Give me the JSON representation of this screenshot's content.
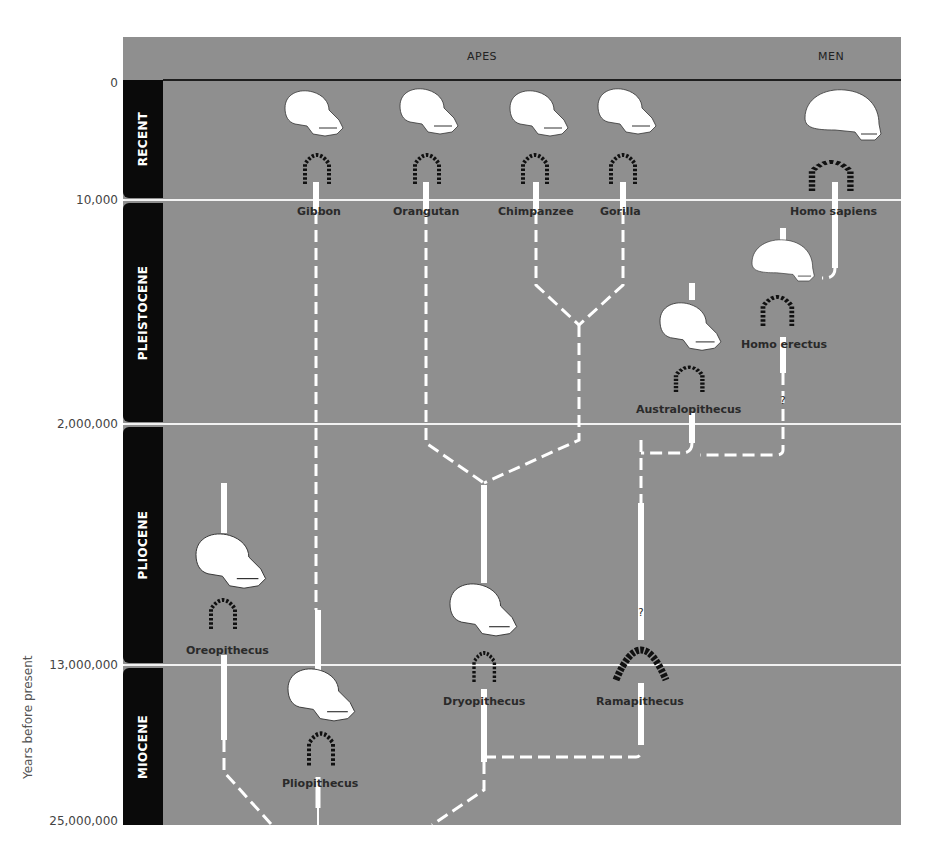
{
  "header": {
    "group_apes": "APES",
    "group_men": "MEN"
  },
  "axis": {
    "title": "Years before present",
    "ticks": [
      "0",
      "10,000",
      "2,000,000",
      "13,000,000",
      "25,000,000"
    ]
  },
  "epochs": [
    {
      "name": "RECENT"
    },
    {
      "name": "PLEISTOCENE"
    },
    {
      "name": "PLIOCENE"
    },
    {
      "name": "MIOCENE"
    }
  ],
  "species": [
    {
      "name": "Gibbon",
      "group": "apes"
    },
    {
      "name": "Orangutan",
      "group": "apes"
    },
    {
      "name": "Chimpanzee",
      "group": "apes"
    },
    {
      "name": "Gorilla",
      "group": "apes"
    },
    {
      "name": "Homo sapiens",
      "group": "men"
    },
    {
      "name": "Homo erectus",
      "group": "men"
    },
    {
      "name": "Australopithecus",
      "group": "men"
    },
    {
      "name": "Oreopithecus",
      "group": "extinct"
    },
    {
      "name": "Dryopithecus",
      "group": "extinct"
    },
    {
      "name": "Ramapithecus",
      "group": "extinct"
    },
    {
      "name": "Pliopithecus",
      "group": "extinct"
    }
  ],
  "annotations": {
    "uncertain_mark": "?"
  },
  "colors": {
    "panel": "#8f8f8f",
    "epoch_bar": "#0a0a0a",
    "lineage": "#ffffff",
    "label": "#2a2a2a"
  }
}
